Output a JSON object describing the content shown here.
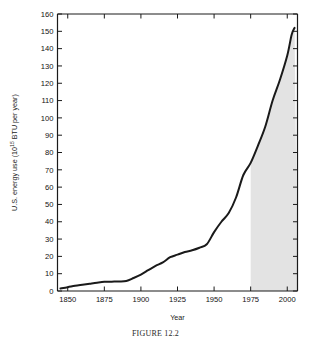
{
  "figure": {
    "caption": "FIGURE 12.2"
  },
  "chart_data": {
    "type": "area",
    "title": "",
    "xlabel": "Year",
    "ylabel_prefix": "U.S. energy use (10",
    "ylabel_exponent": "15",
    "ylabel_suffix": " BTU per year)",
    "ylabel_full": "U.S. energy use (10^15 BTU per year)",
    "xlim": [
      1843,
      2007
    ],
    "ylim": [
      0,
      160
    ],
    "xticks": [
      1850,
      1875,
      1900,
      1925,
      1950,
      1975,
      2000
    ],
    "xtick_labels": [
      "1850",
      "1875",
      "1900",
      "1925",
      "1950",
      "1975",
      "2000"
    ],
    "yticks": [
      0,
      10,
      20,
      30,
      40,
      50,
      60,
      70,
      80,
      90,
      100,
      110,
      120,
      130,
      140,
      150,
      160
    ],
    "ytick_labels": [
      "0",
      "10",
      "20",
      "30",
      "40",
      "50",
      "60",
      "70",
      "80",
      "90",
      "100",
      "110",
      "120",
      "130",
      "140",
      "150",
      "160"
    ],
    "grid": false,
    "legend": null,
    "series": [
      {
        "name": "U.S. energy use",
        "line_color": "#1a1a1a",
        "x": [
          1845,
          1850,
          1855,
          1860,
          1865,
          1870,
          1875,
          1880,
          1885,
          1890,
          1895,
          1900,
          1905,
          1910,
          1915,
          1920,
          1925,
          1930,
          1935,
          1940,
          1945,
          1950,
          1955,
          1960,
          1965,
          1970,
          1975,
          1980,
          1985,
          1990,
          1995,
          2000,
          2003,
          2005
        ],
        "values": [
          1.5,
          2.2,
          3.0,
          3.6,
          4.2,
          4.8,
          5.3,
          5.4,
          5.5,
          5.8,
          7.5,
          9.5,
          12.0,
          14.5,
          16.5,
          19.5,
          21.0,
          22.5,
          23.5,
          25.0,
          27.0,
          34.0,
          40.0,
          45.0,
          54.0,
          67.0,
          74.0,
          84.0,
          95.0,
          110.0,
          122.0,
          136.0,
          148.0,
          152.0
        ]
      }
    ],
    "shaded_region": {
      "label": "projected",
      "x_start": 1975,
      "x_end": 2005,
      "fill_color": "#e3e3e3"
    },
    "axis_color": "#1a1a1a",
    "background_color": "#ffffff"
  }
}
